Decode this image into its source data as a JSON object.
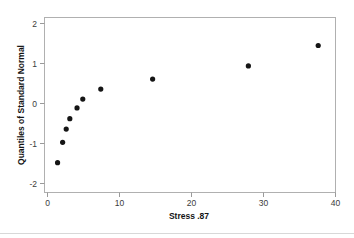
{
  "chart_data": {
    "type": "scatter",
    "title": "",
    "xlabel": "Stress .87",
    "ylabel": "Quantiles of Standard Normal",
    "xlim": [
      0,
      41
    ],
    "ylim": [
      -2.3,
      2.3
    ],
    "xticks": [
      "0",
      "10",
      "20",
      "30",
      "40"
    ],
    "xtick_values": [
      0,
      10,
      20,
      30,
      40
    ],
    "yticks": [
      "2",
      "1",
      "0",
      "-1",
      "-2"
    ],
    "ytick_values": [
      2,
      1,
      0,
      -1,
      -2
    ],
    "grid": false,
    "legend": false,
    "marker": "filled-circle",
    "marker_color": "#151515",
    "points": [
      {
        "x": 1.4,
        "y": -1.48
      },
      {
        "x": 2.1,
        "y": -0.97
      },
      {
        "x": 2.6,
        "y": -0.64
      },
      {
        "x": 3.1,
        "y": -0.38
      },
      {
        "x": 4.1,
        "y": -0.11
      },
      {
        "x": 4.9,
        "y": 0.11
      },
      {
        "x": 7.4,
        "y": 0.36
      },
      {
        "x": 14.6,
        "y": 0.61
      },
      {
        "x": 27.9,
        "y": 0.94
      },
      {
        "x": 37.6,
        "y": 1.45
      }
    ],
    "x": [
      1.4,
      2.1,
      2.6,
      3.1,
      4.1,
      4.9,
      7.4,
      14.6,
      27.9,
      37.6
    ],
    "values": [
      -1.48,
      -0.97,
      -0.64,
      -0.38,
      -0.11,
      0.11,
      0.36,
      0.61,
      0.94,
      1.45
    ]
  },
  "colors": {
    "background": "#ffffff",
    "frame": "#b0b0b0",
    "marker": "#151515",
    "tick_text": "#3b3b3b",
    "title_text": "#141414"
  }
}
